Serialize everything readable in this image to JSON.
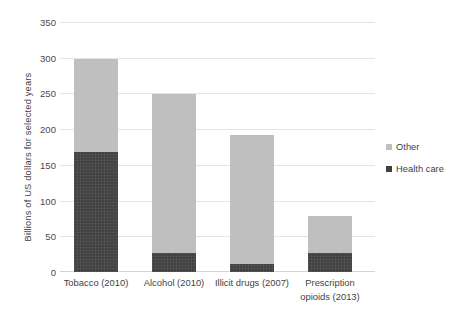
{
  "chart_data": {
    "type": "bar",
    "subtype": "stacked-vertical",
    "title": "",
    "xlabel": "",
    "ylabel": "Billions of US dollars for selected years",
    "ylim": [
      0,
      350
    ],
    "yticks": [
      0,
      50,
      100,
      150,
      200,
      250,
      300,
      350
    ],
    "ytick_labels": [
      "0",
      "50",
      "100",
      "150",
      "200",
      "250",
      "300",
      "350"
    ],
    "grid": true,
    "grid_axis": "y",
    "legend_position": "right",
    "categories": [
      "Tobacco (2010)",
      "Alcohol (2010)",
      "Illicit drugs (2007)",
      "Prescription opioids (2013)"
    ],
    "category_lines": [
      [
        "Tobacco (2010)"
      ],
      [
        "Alcohol (2010)"
      ],
      [
        "Illicit drugs (2007)"
      ],
      [
        "Prescription",
        "opioids (2013)"
      ]
    ],
    "series": [
      {
        "name": "Health care",
        "color": "#414141",
        "values": [
          168,
          27,
          11,
          27
        ]
      },
      {
        "name": "Other",
        "color": "#bfbfbf",
        "values": [
          132,
          223,
          182,
          52
        ]
      }
    ],
    "totals": [
      300,
      250,
      193,
      79
    ],
    "stack_order": [
      "Health care",
      "Other"
    ]
  },
  "legend": {
    "items": [
      {
        "label": "Other",
        "color": "#bfbfbf"
      },
      {
        "label": "Health care",
        "color": "#414141"
      }
    ]
  },
  "colors": {
    "other": "#bfbfbf",
    "health_care": "#414141",
    "gridline": "#e4e4e4",
    "text": "#3f3f3f",
    "background": "#ffffff"
  }
}
